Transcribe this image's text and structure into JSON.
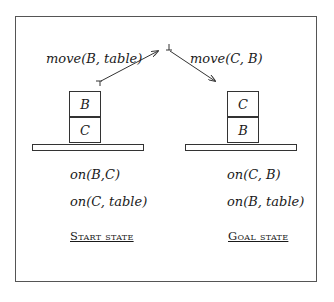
{
  "diagram": {
    "type": "blocks-world-plan",
    "actions": [
      {
        "label": "move(B, table)"
      },
      {
        "label": "move(C, B)"
      }
    ],
    "start": {
      "stack_top": "B",
      "stack_bottom": "C",
      "facts": [
        "on(B,C)",
        "on(C, table)"
      ],
      "title": "Start state"
    },
    "goal": {
      "stack_top": "C",
      "stack_bottom": "B",
      "facts": [
        "on(C, B)",
        "on(B, table)"
      ],
      "title": "Goal state"
    }
  }
}
